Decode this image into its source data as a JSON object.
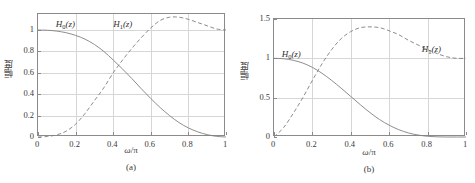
{
  "figure": {
    "axis_label_y": "幅度",
    "axis_label_x_omega": "ω",
    "axis_label_x_slash": "/",
    "axis_label_x_pi": "π"
  },
  "panels": [
    {
      "id": "a",
      "subcaption": "(a)",
      "xlabel": "ω/π",
      "ylabel": "幅度",
      "xticks": [
        "0",
        "0.2",
        "0.4",
        "0.6",
        "0.8",
        "1"
      ],
      "yticks": [
        "0",
        "0.2",
        "0.4",
        "0.6",
        "0.8",
        "1"
      ],
      "labels": [
        {
          "name": "H0",
          "head": "H",
          "sub": "0",
          "tail": "(z)"
        },
        {
          "name": "H1",
          "head": "H",
          "sub": "1",
          "tail": "(z)"
        }
      ]
    },
    {
      "id": "b",
      "subcaption": "(b)",
      "xlabel": "ω/π",
      "ylabel": "幅度",
      "xticks": [
        "0",
        "0.2",
        "0.4",
        "0.6",
        "0.8",
        "1"
      ],
      "yticks": [
        "0",
        "0.5",
        "1",
        "1.5"
      ],
      "labels": [
        {
          "name": "H0",
          "head": "H",
          "sub": "0",
          "tail": "(z)"
        },
        {
          "name": "H1",
          "head": "H",
          "sub": "1",
          "tail": "(z)"
        }
      ]
    }
  ],
  "chart_data": [
    {
      "type": "line",
      "title": "(a)",
      "xlabel": "ω/π",
      "ylabel": "幅度",
      "xlim": [
        0,
        1
      ],
      "ylim": [
        0,
        1.15
      ],
      "xticks": [
        0,
        0.2,
        0.4,
        0.6,
        0.8,
        1
      ],
      "yticks": [
        0,
        0.2,
        0.4,
        0.6,
        0.8,
        1
      ],
      "grid": true,
      "legend": "inline-annotations",
      "x": [
        0,
        0.05,
        0.1,
        0.15,
        0.2,
        0.25,
        0.3,
        0.35,
        0.4,
        0.45,
        0.5,
        0.55,
        0.6,
        0.65,
        0.7,
        0.75,
        0.8,
        0.85,
        0.9,
        0.95,
        1
      ],
      "series": [
        {
          "name": "H0(z)",
          "style": "solid",
          "color": "#808080",
          "values": [
            1.0,
            0.998,
            0.99,
            0.975,
            0.95,
            0.915,
            0.865,
            0.8,
            0.72,
            0.635,
            0.545,
            0.45,
            0.36,
            0.275,
            0.2,
            0.135,
            0.085,
            0.048,
            0.022,
            0.006,
            0.0
          ]
        },
        {
          "name": "H1(z)",
          "style": "dashed",
          "color": "#808080",
          "values": [
            0.0,
            0.005,
            0.02,
            0.055,
            0.12,
            0.22,
            0.34,
            0.46,
            0.6,
            0.72,
            0.83,
            0.93,
            1.02,
            1.09,
            1.12,
            1.12,
            1.1,
            1.07,
            1.04,
            1.01,
            1.0
          ]
        }
      ]
    },
    {
      "type": "line",
      "title": "(b)",
      "xlabel": "ω/π",
      "ylabel": "幅度",
      "xlim": [
        0,
        1
      ],
      "ylim": [
        0,
        1.5
      ],
      "xticks": [
        0,
        0.2,
        0.4,
        0.6,
        0.8,
        1
      ],
      "yticks": [
        0,
        0.5,
        1,
        1.5
      ],
      "grid": true,
      "legend": "inline-annotations",
      "x": [
        0,
        0.05,
        0.1,
        0.15,
        0.2,
        0.25,
        0.3,
        0.35,
        0.4,
        0.45,
        0.5,
        0.55,
        0.6,
        0.65,
        0.7,
        0.75,
        0.8,
        0.85,
        0.9,
        0.95,
        1
      ],
      "series": [
        {
          "name": "H0(z)",
          "style": "solid",
          "color": "#808080",
          "values": [
            1.0,
            0.995,
            0.975,
            0.94,
            0.885,
            0.81,
            0.72,
            0.62,
            0.515,
            0.41,
            0.31,
            0.222,
            0.15,
            0.093,
            0.052,
            0.025,
            0.009,
            0.002,
            0.0,
            0.0,
            0.0
          ]
        },
        {
          "name": "H1(z)",
          "style": "dashed",
          "color": "#808080",
          "values": [
            0.0,
            0.12,
            0.3,
            0.5,
            0.72,
            0.93,
            1.11,
            1.25,
            1.34,
            1.39,
            1.4,
            1.39,
            1.35,
            1.3,
            1.23,
            1.17,
            1.11,
            1.06,
            1.02,
            1.0,
            1.0
          ]
        }
      ]
    }
  ]
}
